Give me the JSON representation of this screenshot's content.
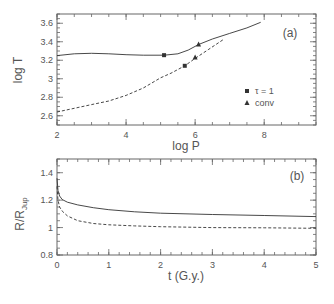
{
  "chart_data": [
    {
      "panel": "(a)",
      "type": "line",
      "xlabel": "log P",
      "ylabel": "log T",
      "xlim": [
        2,
        9.5
      ],
      "ylim": [
        2.5,
        3.7
      ],
      "xticks": [
        "2",
        "4",
        "6",
        "8"
      ],
      "yticks": [
        "2.6",
        "2.8",
        "3",
        "3.2",
        "3.4",
        "3.6"
      ],
      "grid": false,
      "legend": [
        {
          "marker": "square",
          "label": "τ = 1"
        },
        {
          "marker": "triangle",
          "label": "conv"
        }
      ],
      "legend_position": "lower right",
      "series": [
        {
          "name": "solid",
          "style": "solid",
          "x": [
            2.0,
            2.5,
            3.0,
            3.5,
            4.0,
            4.5,
            5.1,
            5.5,
            5.8,
            6.1,
            6.5,
            7.0,
            7.5,
            7.9
          ],
          "y": [
            3.25,
            3.27,
            3.275,
            3.27,
            3.26,
            3.255,
            3.255,
            3.27,
            3.31,
            3.37,
            3.43,
            3.49,
            3.55,
            3.61
          ]
        },
        {
          "name": "dashed",
          "style": "dashed",
          "x": [
            2.0,
            2.5,
            3.0,
            3.5,
            4.0,
            4.5,
            5.0,
            5.3,
            5.7,
            6.0,
            6.4,
            6.8
          ],
          "y": [
            2.64,
            2.68,
            2.72,
            2.76,
            2.82,
            2.9,
            3.01,
            3.06,
            3.14,
            3.22,
            3.32,
            3.42
          ]
        }
      ],
      "markers": [
        {
          "type": "square",
          "x": 5.1,
          "y": 3.255
        },
        {
          "type": "square",
          "x": 5.7,
          "y": 3.14
        },
        {
          "type": "triangle",
          "x": 6.1,
          "y": 3.37
        },
        {
          "type": "triangle",
          "x": 6.0,
          "y": 3.23
        }
      ]
    },
    {
      "panel": "(b)",
      "type": "line",
      "xlabel": "t (G.y.)",
      "ylabel": "R/R_Jup",
      "xlim": [
        0,
        5
      ],
      "ylim": [
        0.8,
        1.5
      ],
      "xticks": [
        "0",
        "1",
        "2",
        "3",
        "4",
        "5"
      ],
      "yticks": [
        "0.8",
        "1",
        "1.2",
        "1.4"
      ],
      "grid": false,
      "series": [
        {
          "name": "solid",
          "style": "solid",
          "x": [
            0.0,
            0.02,
            0.05,
            0.1,
            0.2,
            0.4,
            0.7,
            1.0,
            1.5,
            2.0,
            3.0,
            4.0,
            5.0
          ],
          "y": [
            1.36,
            1.27,
            1.23,
            1.205,
            1.185,
            1.165,
            1.145,
            1.13,
            1.115,
            1.105,
            1.095,
            1.088,
            1.08
          ]
        },
        {
          "name": "dashed",
          "style": "dashed",
          "x": [
            0.0,
            0.02,
            0.05,
            0.1,
            0.2,
            0.4,
            0.7,
            1.0,
            1.5,
            2.0,
            3.0,
            4.0,
            5.0
          ],
          "y": [
            1.3,
            1.2,
            1.15,
            1.12,
            1.085,
            1.05,
            1.03,
            1.02,
            1.012,
            1.006,
            1.0,
            0.998,
            0.995
          ]
        }
      ]
    }
  ],
  "labels": {
    "a_panel": "(a)",
    "b_panel": "(b)",
    "a_xlabel": "log P",
    "a_ylabel": "log T",
    "b_xlabel": "t (G.y.)",
    "b_ylabel_main": "R/R",
    "b_ylabel_sub": "Jup",
    "legend_tau": "τ = 1",
    "legend_conv": "conv"
  }
}
